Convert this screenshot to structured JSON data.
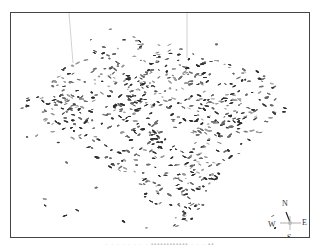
{
  "figure": {
    "palette": {
      "dark": "#2e2e2e",
      "mid": "#6a6a6a",
      "light": "#9a9a9a",
      "frame": "#444444",
      "reference_line": "#c8c8c8"
    },
    "reference_lines": 2
  },
  "compass": {
    "north": "N",
    "east": "E",
    "south": "S",
    "west": "W"
  },
  "caption": {
    "text": "· · · · · · · ·  ▪▪▪▪▪▪▪▪▪▪▪▪  · · · ▪▪"
  }
}
